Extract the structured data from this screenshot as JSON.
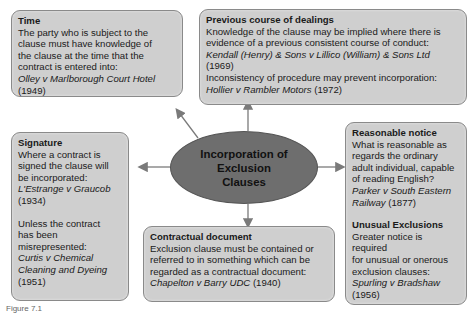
{
  "center": {
    "line1": "Incorporation of",
    "line2": "Exclusion",
    "line3": "Clauses"
  },
  "boxes": {
    "time": {
      "title": "Time",
      "lines": [
        "The party who is subject to the",
        "clause must have knowledge of",
        "the clause at the time that the",
        "contract is entered into:"
      ],
      "case": "Olley v Marlborough Court Hotel",
      "year": "(1949)"
    },
    "previous": {
      "title": "Previous course of dealings",
      "lines": [
        "Knowledge of the clause may be implied where there is",
        "evidence of a previous consistent course of conduct:"
      ],
      "case1": "Kendall (Henry) & Sons v Lillico (William) & Sons Ltd",
      "year1": "(1969)",
      "line3": "Inconsistency of procedure may prevent incorporation:",
      "case2": "Hollier v Rambler Motors",
      "year2": "(1972)"
    },
    "signature": {
      "title": "Signature",
      "lines": [
        "Where a contract is",
        "signed the clause will",
        "be incorporated:"
      ],
      "case1": "L'Estrange v Graucob",
      "year1": "(1934)",
      "lines2": [
        "Unless the contract",
        "has been",
        "misrepresented:"
      ],
      "case2a": "Curtis v Chemical",
      "case2b": "Cleaning and Dyeing",
      "year2": "(1951)"
    },
    "contractual": {
      "title": "Contractual document",
      "lines": [
        "Exclusion clause must be contained or",
        "referred to in something which can be",
        "regarded as a contractual document:"
      ],
      "case": "Chapelton v Barry UDC",
      "year": "(1940)"
    },
    "reasonable": {
      "title": "Reasonable notice",
      "lines": [
        "What is reasonable as",
        "regards the ordinary",
        "adult individual, capable",
        "of reading English?"
      ],
      "case_a": "Parker v South Eastern",
      "case_b": "Railway",
      "year": "(1877)",
      "title2": "Unusual Exclusions",
      "lines2": [
        "Greater notice is required",
        "for unusual or onerous",
        "exclusion clauses:"
      ],
      "case2": "Spurling v Bradshaw",
      "year2": "(1956)"
    }
  },
  "caption": "Figure 7.1",
  "colors": {
    "box_fill": "#cfcfcf",
    "ellipse_fill": "#6e6e6e",
    "arrow": "#7a7a7a"
  }
}
